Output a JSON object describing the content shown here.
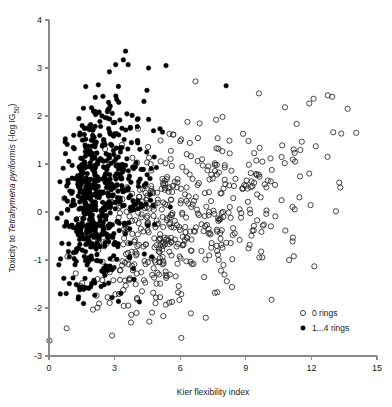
{
  "chart_data": {
    "type": "scatter",
    "title": "",
    "xlabel": "Kier flexibility index",
    "ylabel_plain": "Toxicity to Tetrahymena pyriformis (-log IG50)",
    "ylabel_parts": {
      "pre": "Toxicity to ",
      "italic": "Tetrahymena pyriformis",
      "post": " (-log IG",
      "subscript": "50",
      "tail": ")"
    },
    "xlim": [
      0,
      15
    ],
    "ylim": [
      -3,
      4
    ],
    "xticks": [
      0,
      3,
      6,
      9,
      12,
      15
    ],
    "yticks": [
      -3,
      -2,
      -1,
      0,
      1,
      2,
      3,
      4
    ],
    "xtick_labels": [
      "0",
      "3",
      "6",
      "9",
      "12",
      "15"
    ],
    "ytick_labels": [
      "-3",
      "-2",
      "-1",
      "0",
      "1",
      "2",
      "3",
      "4"
    ],
    "grid": false,
    "legend_position": "bottom-right",
    "marker_radius_px": 2.6,
    "series": [
      {
        "name": "0 rings",
        "marker": "open-circle",
        "color": "#262626",
        "fill": "none",
        "n_points": 520,
        "x_center": 5.6,
        "y_center": -0.25,
        "x_spread": 2.35,
        "y_spread": 0.95,
        "x_range": [
          0.0,
          14.1
        ],
        "y_range": [
          -2.7,
          2.75
        ],
        "correlation": 0.45,
        "seed": 20260131
      },
      {
        "name": "1...4 rings",
        "marker": "filled-circle",
        "color": "#000000",
        "fill": "#000000",
        "n_points": 640,
        "x_center": 2.15,
        "y_center": 0.35,
        "x_spread": 0.95,
        "y_spread": 0.95,
        "x_range": [
          0.35,
          8.2
        ],
        "y_range": [
          -1.95,
          3.35
        ],
        "correlation": 0.2,
        "seed": 77712345
      }
    ],
    "outliers": [
      {
        "series": "0 rings",
        "x": 0.02,
        "y": -2.68
      },
      {
        "series": "1...4 rings",
        "x": 0.5,
        "y": 0.63
      },
      {
        "series": "1...4 rings",
        "x": 0.38,
        "y": -0.13
      },
      {
        "series": "1...4 rings",
        "x": 0.45,
        "y": -1.1
      },
      {
        "series": "1...4 rings",
        "x": 3.5,
        "y": 3.35
      },
      {
        "series": "1...4 rings",
        "x": 3.05,
        "y": 3.07
      },
      {
        "series": "1...4 rings",
        "x": 3.62,
        "y": 3.07
      },
      {
        "series": "1...4 rings",
        "x": 5.35,
        "y": 3.05
      },
      {
        "series": "1...4 rings",
        "x": 8.1,
        "y": 2.63
      },
      {
        "series": "0 rings",
        "x": 6.7,
        "y": 2.72
      },
      {
        "series": "0 rings",
        "x": 14.05,
        "y": 1.65
      },
      {
        "series": "0 rings",
        "x": 13.0,
        "y": 1.66
      },
      {
        "series": "0 rings",
        "x": 12.95,
        "y": 2.4
      },
      {
        "series": "0 rings",
        "x": 12.75,
        "y": 2.43
      },
      {
        "series": "0 rings",
        "x": 12.1,
        "y": 2.36
      },
      {
        "series": "0 rings",
        "x": 12.2,
        "y": 1.37
      },
      {
        "series": "0 rings",
        "x": 11.9,
        "y": 0.8
      },
      {
        "series": "0 rings",
        "x": 10.35,
        "y": -0.09
      }
    ]
  },
  "legend": {
    "items": [
      {
        "label": "0 rings",
        "marker": "open-circle"
      },
      {
        "label": "1...4 rings",
        "marker": "filled-circle"
      }
    ]
  },
  "axes": {
    "x_title": "Kier flexibility index",
    "y_title_pre": "Toxicity to ",
    "y_title_italic": "Tetrahymena pyriformis",
    "y_title_post": " (-log IG",
    "y_title_sub": "50",
    "y_title_tail": ")"
  },
  "colors": {
    "axis": "#8a8a8a",
    "text": "#1a1a1a",
    "open_marker_stroke": "#262626",
    "filled_marker": "#000000",
    "background": "#ffffff"
  }
}
